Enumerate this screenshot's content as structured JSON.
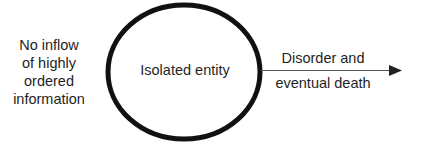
{
  "diagram": {
    "left_text": {
      "lines": [
        "No inflow",
        "of highly",
        "ordered",
        "information"
      ]
    },
    "entity": {
      "label": "Isolated entity",
      "shape": "ellipse",
      "stroke_color": "#111111"
    },
    "arrow": {
      "label_line1": "Disorder and",
      "label_line2": "eventual death",
      "color": "#444444"
    }
  }
}
